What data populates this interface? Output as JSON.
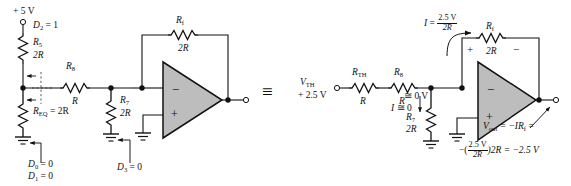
{
  "figure": {
    "type": "circuit-diagram",
    "equivalence_symbol": "≡"
  },
  "left_circuit": {
    "name": "original-ladder-circuit",
    "supply_label": "+ 5 V",
    "d2_label": "D",
    "d2_sub": "2",
    "d2_value": " = 1",
    "r5_name": "R",
    "r5_sub": "5",
    "r5_value": "2R",
    "r8_name": "R",
    "r8_sub": "8",
    "r8_value": "R",
    "req_label": "R",
    "req_sub": "EQ",
    "req_value": " = 2R",
    "r7_name": "R",
    "r7_sub": "7",
    "r7_value": "2R",
    "rf_name": "R",
    "rf_sub": "f",
    "rf_value": "2R",
    "d0_label": "D",
    "d0_sub": "0",
    "d0_value": " = 0",
    "d1_label": "D",
    "d1_sub": "1",
    "d1_value": " = 0",
    "d3_label": "D",
    "d3_sub": "3",
    "d3_value": " = 0",
    "opamp_minus": "−",
    "opamp_plus": "+"
  },
  "right_circuit": {
    "name": "thevenin-equivalent-circuit",
    "vth_label": "V",
    "vth_sub": "TH",
    "vth_value": "+ 2.5 V",
    "rth_name": "R",
    "rth_sub": "TH",
    "rth_value": "R",
    "r8_name": "R",
    "r8_sub": "8",
    "r8_value": "R",
    "r7_name": "R",
    "r7_sub": "7",
    "r7_value": "2R",
    "rf_name": "R",
    "rf_sub": "f",
    "rf_value": "2R",
    "current_label": "I",
    "current_eq": "=",
    "current_num": "2.5 V",
    "current_den": "2R",
    "current_zero_label": "I",
    "current_zero_value": "≅ 0",
    "virtual_ground": "≅ 0 V",
    "rf_polarity_plus": "+",
    "rf_polarity_minus": "−",
    "opamp_minus": "−",
    "opamp_plus": "+",
    "vout_name": "V",
    "vout_sub": "out",
    "vout_eq1": " = −IR",
    "vout_eq1_sub": "f",
    "vout_eq1_tail": " =",
    "vout_line2_prefix": "−(",
    "vout_line2_num": "2.5 V",
    "vout_line2_den": "2R",
    "vout_line2_suffix": ")2R = −2.5 V"
  },
  "colors": {
    "line": "#111111",
    "opamp_fill": "#bdbdbd",
    "background": "#ffffff"
  }
}
